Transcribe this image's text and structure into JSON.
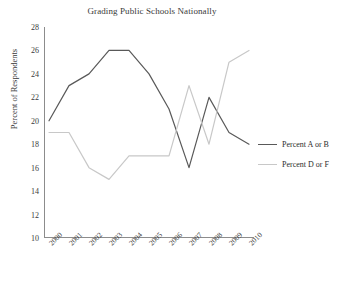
{
  "chart_data": {
    "type": "line",
    "title": "Grading Public Schools Nationally",
    "xlabel": "",
    "ylabel": "Percent of Respondents",
    "categories": [
      "2000",
      "2001",
      "2002",
      "2003",
      "2004",
      "2005",
      "2006",
      "2007",
      "2008",
      "2009",
      "2010"
    ],
    "x": [
      2000,
      2001,
      2002,
      2003,
      2004,
      2005,
      2006,
      2007,
      2008,
      2009,
      2010
    ],
    "ylim": [
      10,
      28
    ],
    "yticks": [
      10,
      12,
      14,
      16,
      18,
      20,
      22,
      24,
      26,
      28
    ],
    "grid": false,
    "legend_position": "right",
    "series": [
      {
        "name": "Percent  A or B",
        "color": "#595959",
        "values": [
          20,
          23,
          24,
          26,
          26,
          24,
          21,
          16,
          22,
          19,
          18
        ]
      },
      {
        "name": "Percent  D or F",
        "color": "#c8c8c8",
        "values": [
          19,
          19,
          16,
          15,
          17,
          17,
          17,
          23,
          18,
          25,
          26
        ]
      }
    ]
  },
  "legend": {
    "entries": [
      {
        "label": "Percent  A or B"
      },
      {
        "label": "Percent  D or F"
      }
    ]
  }
}
